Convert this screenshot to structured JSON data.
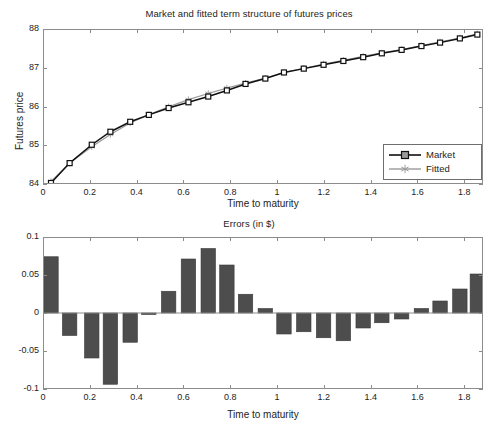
{
  "figure": {
    "width": 498,
    "height": 432,
    "background": "#ffffff"
  },
  "colors": {
    "market_line": "#111111",
    "fitted_line": "#9a9a9a",
    "bar_fill": "#4d4d4d",
    "bar_edge": "#3a3a3a",
    "axis": "#8c8c8c",
    "text": "#1d1d1d"
  },
  "chart_data": [
    {
      "id": "term-structure",
      "type": "line",
      "title": "Market and fitted term structure of futures prices",
      "xlabel": "Time to maturity",
      "ylabel": "Futures price",
      "xlim": [
        0,
        1.88
      ],
      "ylim": [
        84,
        88
      ],
      "xticks": [
        0,
        0.2,
        0.4,
        0.6,
        0.8,
        1,
        1.2,
        1.4,
        1.6,
        1.8
      ],
      "xticklabels": [
        "0",
        "0.2",
        "0.4",
        "0.6",
        "0.8",
        "1",
        "1.2",
        "1.4",
        "1.6",
        "1.8"
      ],
      "yticks": [
        84,
        85,
        86,
        87,
        88
      ],
      "yticklabels": [
        "84",
        "85",
        "86",
        "87",
        "88"
      ],
      "grid": false,
      "legend": {
        "position": "lower-right",
        "entries": [
          {
            "name": "Market",
            "color": "#111111",
            "marker": "square"
          },
          {
            "name": "Fitted",
            "color": "#9a9a9a",
            "marker": "hexagram"
          }
        ]
      },
      "x": [
        0.03,
        0.11,
        0.205,
        0.285,
        0.37,
        0.45,
        0.535,
        0.62,
        0.705,
        0.785,
        0.865,
        0.95,
        1.03,
        1.115,
        1.2,
        1.285,
        1.37,
        1.45,
        1.535,
        1.62,
        1.7,
        1.785,
        1.86
      ],
      "series": [
        {
          "name": "Market",
          "color": "#111111",
          "marker": "square",
          "values": [
            84.0,
            84.52,
            85.0,
            85.34,
            85.6,
            85.78,
            85.96,
            86.11,
            86.26,
            86.42,
            86.59,
            86.73,
            86.89,
            86.99,
            87.09,
            87.19,
            87.29,
            87.39,
            87.48,
            87.58,
            87.67,
            87.78,
            87.88
          ]
        },
        {
          "name": "Fitted",
          "color": "#9a9a9a",
          "marker": "hexagram",
          "values": [
            84.04,
            84.52,
            84.95,
            85.27,
            85.57,
            85.79,
            85.99,
            86.18,
            86.34,
            86.48,
            86.61,
            86.74,
            86.89,
            87.0,
            87.11,
            87.21,
            87.31,
            87.4,
            87.49,
            87.59,
            87.69,
            87.79,
            87.9
          ]
        }
      ]
    },
    {
      "id": "errors",
      "type": "bar",
      "title": "Errors (in $)",
      "xlabel": "Time to maturity",
      "ylabel": "",
      "xlim": [
        0,
        1.88
      ],
      "ylim": [
        -0.1,
        0.1
      ],
      "xticks": [
        0,
        0.2,
        0.4,
        0.6,
        0.8,
        1,
        1.2,
        1.4,
        1.6,
        1.8
      ],
      "xticklabels": [
        "0",
        "0.2",
        "0.4",
        "0.6",
        "0.8",
        "1",
        "1.2",
        "1.4",
        "1.6",
        "1.8"
      ],
      "yticks": [
        -0.1,
        -0.05,
        0,
        0.05,
        0.1
      ],
      "yticklabels": [
        "-0.1",
        "-0.05",
        "0",
        "0.05",
        "0.1"
      ],
      "grid": false,
      "bar_width": 0.062,
      "categories": [
        0.03,
        0.11,
        0.205,
        0.285,
        0.37,
        0.45,
        0.535,
        0.62,
        0.705,
        0.785,
        0.865,
        0.95,
        1.03,
        1.115,
        1.2,
        1.285,
        1.37,
        1.45,
        1.535,
        1.62,
        1.7,
        1.785,
        1.86
      ],
      "values": [
        0.075,
        -0.03,
        -0.06,
        -0.095,
        -0.039,
        -0.002,
        0.029,
        0.072,
        0.086,
        0.064,
        0.025,
        0.006,
        -0.028,
        -0.025,
        -0.033,
        -0.037,
        -0.02,
        -0.013,
        -0.008,
        0.006,
        0.016,
        0.032,
        0.052
      ]
    }
  ]
}
